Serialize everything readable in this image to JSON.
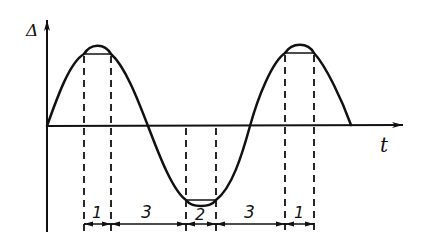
{
  "diagram": {
    "type": "waveform-timing",
    "y_axis_label": "Δ",
    "x_axis_label": "t",
    "curve": "sinusoid with flattened peaks and trough",
    "segments": [
      {
        "label": "1",
        "region": "peak"
      },
      {
        "label": "3",
        "region": "falling"
      },
      {
        "label": "2",
        "region": "trough"
      },
      {
        "label": "3",
        "region": "rising"
      },
      {
        "label": "1",
        "region": "peak"
      }
    ],
    "colors": {
      "line": "#111111",
      "background": "#ffffff"
    }
  }
}
